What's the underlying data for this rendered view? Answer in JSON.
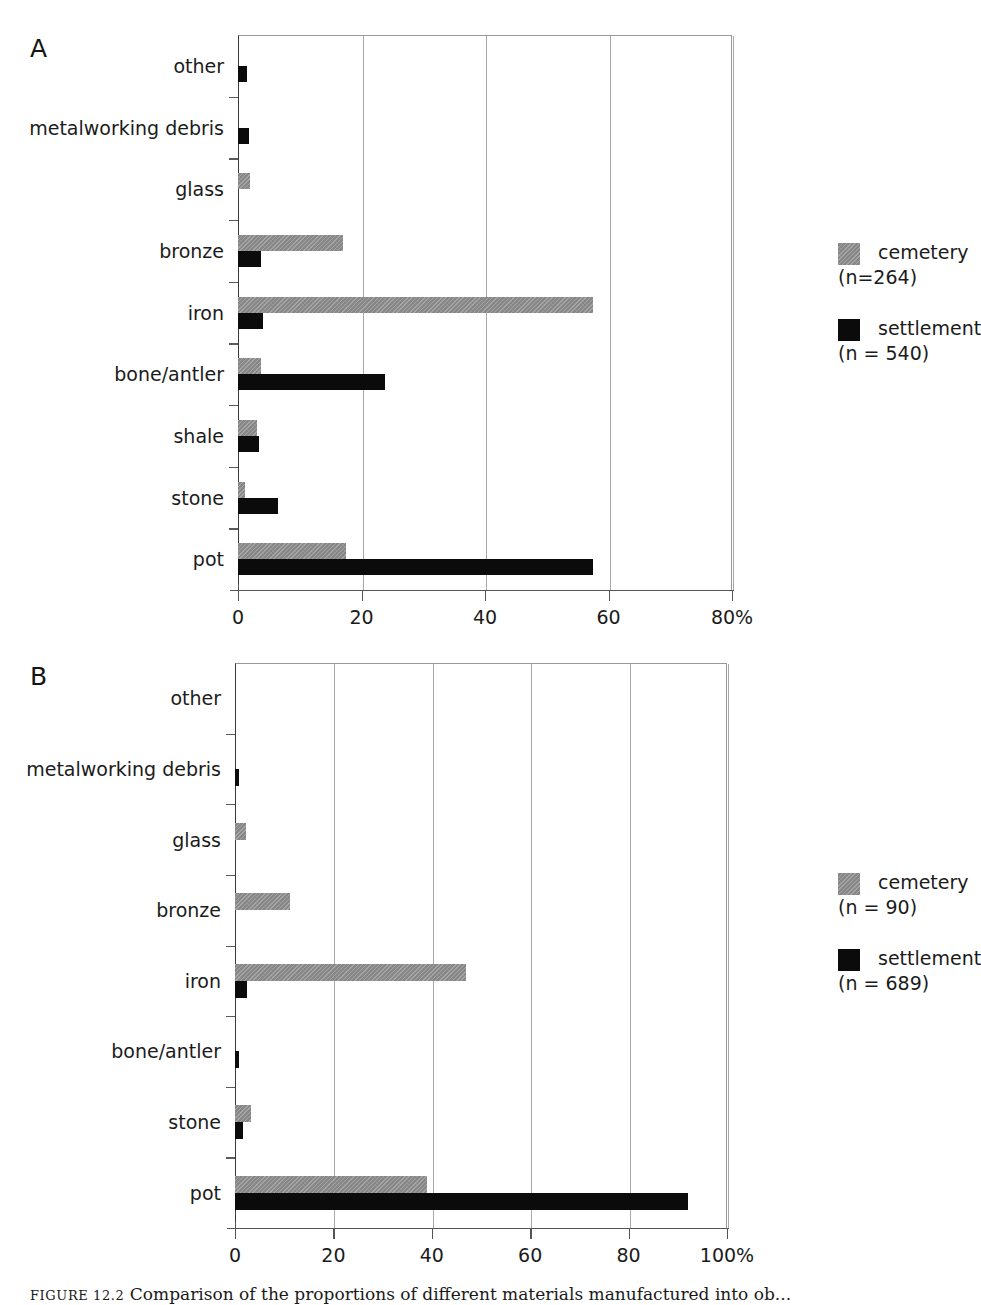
{
  "figure": {
    "caption_number": "FIGURE 12.2",
    "caption_text": "Comparison of the proportions of different materials manufactured into ob..."
  },
  "chart_data": [
    {
      "id": "A",
      "panel_letter": "A",
      "type": "bar",
      "orientation": "horizontal",
      "title": "",
      "xlabel": "",
      "ylabel": "",
      "xlim": [
        0,
        80
      ],
      "xticks": [
        0,
        20,
        40,
        60,
        80
      ],
      "xtick_labels": [
        "0",
        "20",
        "40",
        "60",
        "80%"
      ],
      "grid": true,
      "legend_position": "right",
      "categories": [
        "other",
        "metalworking debris",
        "glass",
        "bronze",
        "iron",
        "bone/antler",
        "shale",
        "stone",
        "pot"
      ],
      "series": [
        {
          "name": "cemetery",
          "legend_label": "cemetery",
          "legend_sub": "(n=264)",
          "color": "#8f8f8f",
          "values": [
            0,
            0,
            2.0,
            17.0,
            57.5,
            3.8,
            3.0,
            1.2,
            17.5
          ]
        },
        {
          "name": "settlement",
          "legend_label": "settlement",
          "legend_sub": "(n = 540)",
          "color": "#0b0b0b",
          "values": [
            1.4,
            1.8,
            0,
            3.7,
            4.0,
            23.8,
            3.4,
            6.5,
            57.5
          ]
        }
      ]
    },
    {
      "id": "B",
      "panel_letter": "B",
      "type": "bar",
      "orientation": "horizontal",
      "title": "",
      "xlabel": "",
      "ylabel": "",
      "xlim": [
        0,
        100
      ],
      "xticks": [
        0,
        20,
        40,
        60,
        80,
        100
      ],
      "xtick_labels": [
        "0",
        "20",
        "40",
        "60",
        "80",
        "100%"
      ],
      "grid": true,
      "legend_position": "right",
      "categories": [
        "other",
        "metalworking debris",
        "glass",
        "bronze",
        "iron",
        "bone/antler",
        "stone",
        "pot"
      ],
      "series": [
        {
          "name": "cemetery",
          "legend_label": "cemetery",
          "legend_sub": "(n = 90)",
          "color": "#8f8f8f",
          "values": [
            0,
            0,
            2.2,
            11.2,
            47.0,
            0,
            3.3,
            39.0
          ]
        },
        {
          "name": "settlement",
          "legend_label": "settlement",
          "legend_sub": "(n = 689)",
          "color": "#0b0b0b",
          "values": [
            0,
            0.9,
            0,
            0,
            2.4,
            0.9,
            1.6,
            92.0
          ]
        }
      ]
    }
  ]
}
